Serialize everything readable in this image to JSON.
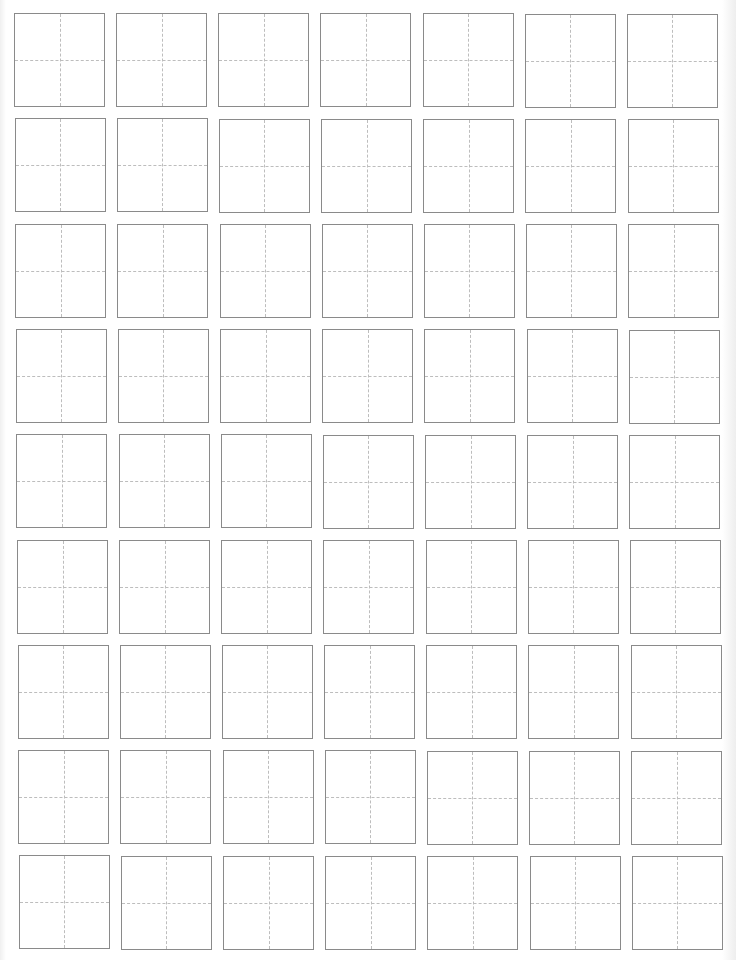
{
  "document": {
    "type": "tian-zi-ge practice sheet",
    "rows": 9,
    "columns": 7,
    "cell_style": "square with dashed center cross guides",
    "colors": {
      "border": "#8a8a8a",
      "guide": "#bdbdbd",
      "paper": "#ffffff"
    }
  }
}
